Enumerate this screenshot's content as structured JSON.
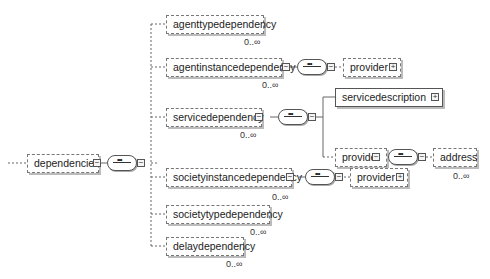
{
  "root": {
    "label": "dependencies"
  },
  "children": [
    {
      "label": "agenttypedependency",
      "cardinality": "0..∞"
    },
    {
      "label": "agentinstancedependency",
      "cardinality": "0..∞",
      "child": "provider"
    },
    {
      "label": "servicedependency",
      "cardinality": "0..∞",
      "children": [
        "servicedescription",
        "provider"
      ],
      "grandchild": {
        "label": "address",
        "cardinality": "0..∞"
      }
    },
    {
      "label": "societyinstancedependency",
      "cardinality": "0..∞",
      "child": "provider"
    },
    {
      "label": "societytypedependency",
      "cardinality": "0..∞"
    },
    {
      "label": "delaydependency",
      "cardinality": "0..∞"
    }
  ],
  "icons": {
    "expand": "⊞",
    "collapse": "⊟"
  }
}
